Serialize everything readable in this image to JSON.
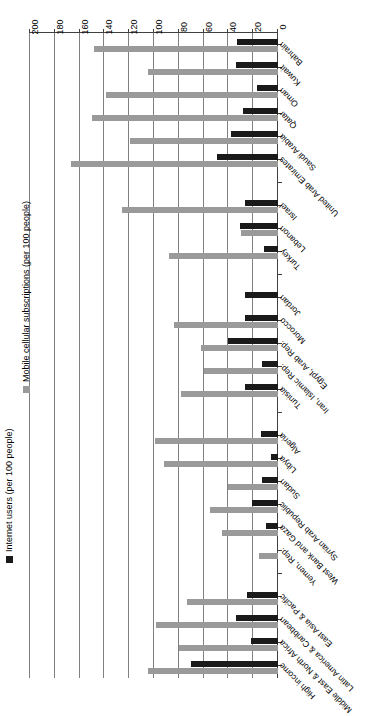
{
  "chart_data": {
    "type": "bar",
    "title": "",
    "orientation": "horizontal",
    "xlabel": "",
    "ylabel": "",
    "xlim": [
      0,
      200
    ],
    "xticks": [
      0,
      20,
      40,
      60,
      80,
      100,
      120,
      140,
      160,
      180,
      200
    ],
    "grid": true,
    "legend_position": "left",
    "categories": [
      "Bahrain",
      "Kuwait",
      "Oman",
      "Qatar",
      "Saudi Arabia",
      "United Arab Emirates",
      "",
      "Israel",
      "Lebanon",
      "Turkey",
      "",
      "Jordan",
      "Morocco",
      "Egypt, Arab Rep.",
      "Iran, Islamic Rep.",
      "Tunisia",
      "",
      "Algeria",
      "Libya",
      "Sudan",
      "Syrian Arab Republic",
      "West Bank and Gaza",
      "Yemen, Rep.",
      "",
      "East Asia & Pacific",
      "Latin America & Caribbean",
      "Middle East & North Africa",
      "High income"
    ],
    "series": [
      {
        "name": "Internet users (per 100 people)",
        "color": "#1a1a1a",
        "values": [
          33,
          34,
          17,
          28,
          38,
          49,
          null,
          27,
          31,
          11,
          null,
          27,
          27,
          40,
          13,
          27,
          null,
          14,
          6,
          13,
          21,
          10,
          0,
          null,
          25,
          34,
          22,
          70
        ]
      },
      {
        "name": "Mobile cellular subscriptions (per 100 people)",
        "color": "#9a9a9a",
        "values": [
          148,
          105,
          139,
          150,
          119,
          167,
          null,
          126,
          30,
          88,
          null,
          0,
          84,
          62,
          60,
          78,
          null,
          99,
          92,
          40,
          55,
          45,
          15,
          null,
          73,
          98,
          80,
          105
        ]
      }
    ]
  },
  "legend": {
    "entries": [
      {
        "label": "Internet users (per 100 people)",
        "swatch": "internet-swatch"
      },
      {
        "label": "Mobile cellular subscriptions (per 100 people)",
        "swatch": "mobile-swatch"
      }
    ]
  }
}
